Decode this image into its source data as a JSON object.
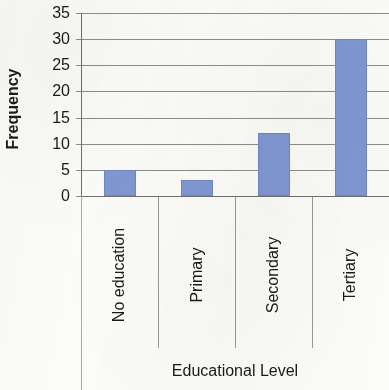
{
  "chart_data": {
    "type": "bar",
    "title": "",
    "xlabel": "Educational Level",
    "ylabel": "Frequency",
    "categories": [
      "No education",
      "Primary",
      "Secondary",
      "Tertiary"
    ],
    "values": [
      5,
      3,
      12,
      30
    ],
    "ylim": [
      0,
      35
    ],
    "yticks": [
      0,
      5,
      10,
      15,
      20,
      25,
      30,
      35
    ],
    "ytick_labels": [
      "0",
      "5",
      "10",
      "15",
      "20",
      "25",
      "30",
      "35"
    ],
    "grid": true,
    "legend": false,
    "bar_color": "#8197D3",
    "gridline_color": "#8D8D8D",
    "axis_color": "#6F6F6F",
    "text_color": "#1A1A1A",
    "background_color": "#FBFBF8",
    "category_label_rotation": -90,
    "ylabel_rotation": -90
  }
}
